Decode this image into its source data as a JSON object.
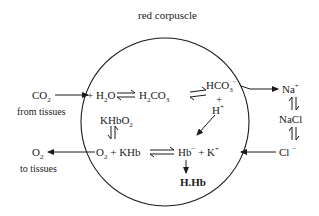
{
  "title": "red corpuscle",
  "external": {
    "co2_in": {
      "species": "CO",
      "sub": "2",
      "note": "from tissues"
    },
    "o2_out": {
      "species": "O",
      "sub": "2",
      "note": "to tissues"
    },
    "na": {
      "species": "Na",
      "sup": "+"
    },
    "nacl": {
      "species": "NaCl"
    },
    "cl": {
      "species": "Cl",
      "sup": "−"
    }
  },
  "internal": {
    "h2o": {
      "prefix": "+ H",
      "sub": "2",
      "suffix": "O"
    },
    "h2co3": {
      "prefix": "H",
      "sub1": "2",
      "mid": "CO",
      "sub2": "3"
    },
    "hco3": {
      "species": "HCO",
      "sub": "3",
      "sup": "−"
    },
    "plus": "+",
    "h_ion": {
      "species": "H",
      "sup": "+"
    },
    "khbo2": {
      "species": "KHbO",
      "sub": "2"
    },
    "o2_khb": {
      "prefix": "O",
      "sub": "2",
      "suffix": " + KHb"
    },
    "hb_k": {
      "prefix": "Hb",
      "sup1": "−",
      "mid": " + K",
      "sup2": "+"
    },
    "hhb": "H.Hb"
  },
  "colors": {
    "ink": "#1a1a1a",
    "background": "#ffffff"
  }
}
